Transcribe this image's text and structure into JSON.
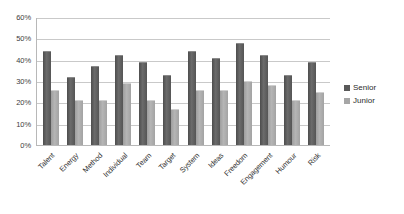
{
  "chart_data": {
    "type": "bar",
    "title": "",
    "subtitle": "",
    "xlabel": "",
    "ylabel": "",
    "ylim": [
      0,
      60
    ],
    "ytick_labels": [
      "60%",
      "50%",
      "40%",
      "30%",
      "20%",
      "10%",
      "0%"
    ],
    "ytick_values": [
      60,
      50,
      40,
      30,
      20,
      10,
      0
    ],
    "grid": true,
    "legend_position": "right",
    "categories": [
      "Talent",
      "Energy",
      "Method",
      "Individual",
      "Team",
      "Target",
      "System",
      "Ideas",
      "Freedom",
      "Engagement",
      "Humour",
      "Risk"
    ],
    "series": [
      {
        "name": "Senior",
        "color": "#595959",
        "values": [
          44,
          32,
          37,
          42,
          39,
          33,
          44,
          41,
          48,
          42,
          33,
          39
        ]
      },
      {
        "name": "Junior",
        "color": "#a6a6a6",
        "values": [
          26,
          21,
          21,
          29,
          21,
          17,
          26,
          26,
          30,
          28,
          21,
          25
        ]
      }
    ]
  },
  "legend": {
    "items": [
      {
        "label": "Senior",
        "color": "#595959"
      },
      {
        "label": "Junior",
        "color": "#a6a6a6"
      }
    ]
  }
}
